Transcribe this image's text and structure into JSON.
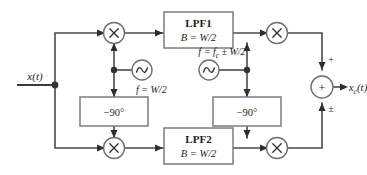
{
  "diagram": {
    "input": {
      "label": "x(t)"
    },
    "output": {
      "label": "x",
      "sub": "c",
      "suffix": "(t)"
    },
    "blocks": {
      "lpf1": {
        "name": "LPF1",
        "bandwidth": "B = W/2"
      },
      "lpf2": {
        "name": "LPF2",
        "bandwidth": "B = W/2"
      },
      "phase_shift_left": {
        "label": "−90°"
      },
      "phase_shift_right": {
        "label": "−90°"
      }
    },
    "oscillators": {
      "left": {
        "symbol": "sine-wave",
        "frequency": "f = W/2"
      },
      "right": {
        "symbol": "sine-wave",
        "frequency_prefix": "f = f",
        "frequency_sub": "c",
        "frequency_suffix": " ± W/2"
      }
    },
    "multipliers": [
      {
        "id": "mult-top-left",
        "symbol": "×"
      },
      {
        "id": "mult-top-right",
        "symbol": "×"
      },
      {
        "id": "mult-bottom-left",
        "symbol": "×"
      },
      {
        "id": "mult-bottom-right",
        "symbol": "×"
      }
    ],
    "summer": {
      "symbol": "+",
      "top_sign": "+",
      "bottom_sign": "±"
    },
    "colors": {
      "wire": "#4a4a4a",
      "block_border": "#7b7b82",
      "circle_border": "#6e6e76",
      "text": "#1d1d1d",
      "background": "#ffffff"
    }
  }
}
